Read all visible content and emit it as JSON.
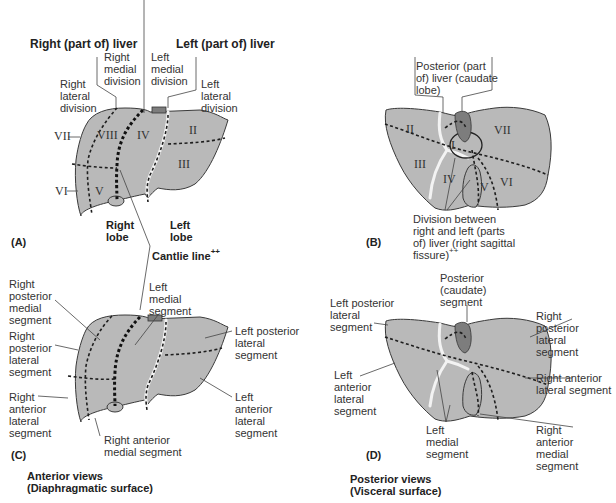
{
  "figure": {
    "panels": [
      {
        "id": "A",
        "label": "(A)"
      },
      {
        "id": "B",
        "label": "(B)"
      },
      {
        "id": "C",
        "label": "(C)"
      },
      {
        "id": "D",
        "label": "(D)"
      }
    ],
    "captions": {
      "anterior": "Anterior views\n(Diaphragmatic surface)",
      "posterior": "Posterior views\n(Visceral surface)"
    },
    "colors": {
      "liver_fill": "#b9b9b9",
      "liver_outline": "#3a3a3a",
      "caudate_fill": "#7d7d7d",
      "fissure": "#f2f2f2",
      "background": "#ffffff"
    }
  },
  "panel_a": {
    "right_liver": "Right (part of) liver",
    "left_liver": "Left (part of) liver",
    "right_medial_division": "Right\nmedial\ndivision",
    "left_medial_division": "Left\nmedial\ndivision",
    "right_lateral_division": "Right\nlateral\ndivision",
    "left_lateral_division": "Left\nlateral\ndivision",
    "right_lobe": "Right\nlobe",
    "left_lobe": "Left\nlobe",
    "cantlie_line": "Cantlie line",
    "cantlie_sup": "++",
    "segments": {
      "VII": "VII",
      "VIII": "VIII",
      "IV": "IV",
      "II": "II",
      "III": "III",
      "VI": "VI",
      "V": "V"
    }
  },
  "panel_b": {
    "posterior_caudate": "Posterior (part\nof) liver (caudate\nlobe)",
    "division": "Division between\nright and left (parts\nof) liver (right sagittal\nfissure)",
    "division_sup": "++",
    "segments": {
      "II": "II",
      "I": "I",
      "VII": "VII",
      "III": "III",
      "IV": "IV",
      "V": "V",
      "VI": "VI"
    }
  },
  "panel_c": {
    "right_posterior_medial": "Right\nposterior\nmedial\nsegment",
    "right_posterior_lateral": "Right\nposterior\nlateral\nsegment",
    "right_anterior_lateral": "Right\nanterior\nlateral\nsegment",
    "right_anterior_medial": "Right anterior\nmedial segment",
    "left_medial": "Left\nmedial\nsegment",
    "left_posterior_lateral": "Left posterior\nlateral\nsegment",
    "left_anterior_lateral": "Left\nanterior\nlateral\nsegment"
  },
  "panel_d": {
    "posterior_caudate": "Posterior\n(caudate)\nsegment",
    "left_posterior_lateral": "Left posterior\nlateral\nsegment",
    "right_posterior_lateral": "Right\nposterior\nlateral\nsegment",
    "left_anterior_lateral": "Left\nanterior\nlateral\nsegment",
    "right_anterior_lateral": "Right anterior\nlateral segment",
    "left_medial": "Left\nmedial\nsegment",
    "right_anterior_medial": "Right\nanterior\nmedial\nsegment"
  }
}
